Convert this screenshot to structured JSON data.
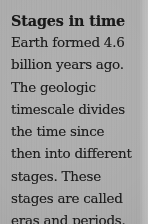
{
  "page": {
    "background_color": "#adadad",
    "text_color": "#1b1b1b",
    "heading_color": "#191919"
  },
  "article": {
    "heading": "Stages in time",
    "body_lines": [
      "Earth formed 4.6",
      "billion years ago.",
      "The geologic",
      "timescale divides",
      "the time since",
      "then into different",
      "stages. These",
      "stages are called",
      "eras and periods."
    ],
    "body_text": "Earth formed 4.6 billion years ago. The geologic timescale divides the time since then into different stages. These stages are called eras and periods."
  }
}
